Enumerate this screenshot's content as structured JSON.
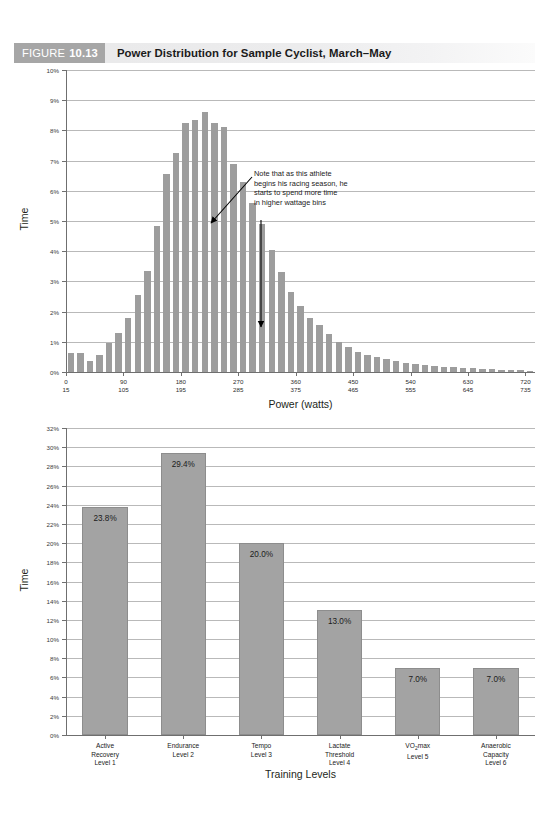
{
  "page": {
    "running_head": "",
    "background": "#ffffff"
  },
  "figure": {
    "tag_word": "FIGURE",
    "tag_number": "10.13",
    "title": "Power Distribution for Sample Cyclist, March–May",
    "tag_bg": "#a6a6a6",
    "bar_bg": "#ececed"
  },
  "annotation": {
    "line1": "Note that as this athlete",
    "line2": "begins his racing season, he",
    "line3": "starts to spend more time",
    "line4": "in higher wattage bins"
  },
  "chart_data": [
    {
      "type": "bar",
      "id": "power-distribution-histogram",
      "title": "Power Distribution for Sample Cyclist, March–May",
      "xlabel": "Power (watts)",
      "ylabel": "Time",
      "ylim": [
        0,
        10
      ],
      "ytick_labels": [
        "0%",
        "1%",
        "2%",
        "3%",
        "4%",
        "5%",
        "6%",
        "7%",
        "8%",
        "9%",
        "10%"
      ],
      "ytick_values": [
        0,
        1,
        2,
        3,
        4,
        5,
        6,
        7,
        8,
        9,
        10
      ],
      "grid": true,
      "legend": "none",
      "bin_width": 15,
      "xtick_top": [
        "0",
        "90",
        "180",
        "270",
        "360",
        "450",
        "540",
        "630",
        "720"
      ],
      "xtick_bottom": [
        "15",
        "105",
        "195",
        "285",
        "375",
        "465",
        "555",
        "645",
        "735"
      ],
      "xtick_values": [
        0,
        90,
        180,
        270,
        360,
        450,
        540,
        630,
        720
      ],
      "bin_starts": [
        0,
        15,
        30,
        45,
        60,
        75,
        90,
        105,
        120,
        135,
        150,
        165,
        180,
        195,
        210,
        225,
        240,
        255,
        270,
        285,
        300,
        315,
        330,
        345,
        360,
        375,
        390,
        405,
        420,
        435,
        450,
        465,
        480,
        495,
        510,
        525,
        540,
        555,
        570,
        585,
        600,
        615,
        630,
        645,
        660,
        675,
        690,
        705,
        720
      ],
      "values": [
        0.62,
        0.62,
        0.35,
        0.55,
        0.95,
        1.28,
        1.78,
        2.55,
        3.35,
        4.82,
        6.55,
        7.25,
        8.25,
        8.35,
        8.6,
        8.25,
        8.1,
        6.9,
        6.3,
        5.6,
        4.9,
        4.05,
        3.3,
        2.65,
        2.2,
        1.8,
        1.55,
        1.25,
        1.0,
        0.82,
        0.66,
        0.55,
        0.5,
        0.42,
        0.35,
        0.3,
        0.25,
        0.22,
        0.2,
        0.18,
        0.15,
        0.13,
        0.12,
        0.1,
        0.09,
        0.08,
        0.07,
        0.06,
        0.05
      ],
      "bar_color": "#9d9d9d",
      "annotation": {
        "text": "Note that as this athlete begins his racing season, he starts to spend more time in higher wattage bins",
        "arrows": 2
      }
    },
    {
      "type": "bar",
      "id": "training-level-distribution",
      "xlabel": "Training Levels",
      "ylabel": "Time",
      "ylim": [
        0,
        32
      ],
      "ytick_labels": [
        "0%",
        "2%",
        "4%",
        "6%",
        "8%",
        "10%",
        "12%",
        "14%",
        "16%",
        "18%",
        "20%",
        "22%",
        "24%",
        "26%",
        "28%",
        "30%",
        "32%"
      ],
      "ytick_values": [
        0,
        2,
        4,
        6,
        8,
        10,
        12,
        14,
        16,
        18,
        20,
        22,
        24,
        26,
        28,
        30,
        32
      ],
      "grid": true,
      "legend": "none",
      "categories": [
        {
          "name": "Active Recovery Level 1",
          "line1": "Active",
          "line2": "Recovery",
          "line3": "Level 1"
        },
        {
          "name": "Endurance Level 2",
          "line1": "Endurance",
          "line2": "Level 2",
          "line3": ""
        },
        {
          "name": "Tempo Level 3",
          "line1": "Tempo",
          "line2": "Level 3",
          "line3": ""
        },
        {
          "name": "Lactate Threshold Level 4",
          "line1": "Lactate",
          "line2": "Threshold",
          "line3": "Level 4"
        },
        {
          "name": "VO2max Level 5",
          "line1": "VO₂max",
          "line2": "Level 5",
          "line3": ""
        },
        {
          "name": "Anaerobic Capacity Level 6",
          "line1": "Anaerobic",
          "line2": "Capacity",
          "line3": "Level 6"
        }
      ],
      "values": [
        23.8,
        29.4,
        20.0,
        13.0,
        7.0,
        7.0
      ],
      "data_labels": [
        "23.8%",
        "29.4%",
        "20.0%",
        "13.0%",
        "7.0%",
        "7.0%"
      ],
      "bar_color": "#a3a3a3"
    }
  ]
}
